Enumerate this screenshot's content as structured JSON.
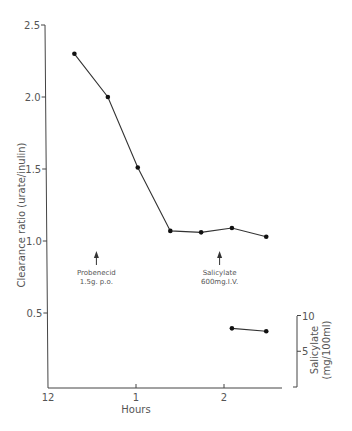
{
  "chart_data": {
    "type": "line",
    "title": "",
    "xlabel": "Hours",
    "ylabel": "Clearance ratio (urate/inulin)",
    "y2label": "Salicylate (mg/100ml)",
    "x_ticks": [
      "12",
      "1",
      "2"
    ],
    "x_tick_values": [
      0,
      1,
      2
    ],
    "y_ticks": [
      "0.5",
      "1.0",
      "1.5",
      "2.0",
      "2.5"
    ],
    "y_tick_values": [
      0.5,
      1.0,
      1.5,
      2.0,
      2.5
    ],
    "y2_ticks": [
      "5",
      "10"
    ],
    "y2_tick_values": [
      5,
      10
    ],
    "xlim": [
      0,
      2.65
    ],
    "ylim": [
      0.0,
      2.5
    ],
    "y2lim": [
      0,
      10
    ],
    "grid": false,
    "legend": "none",
    "series": [
      {
        "name": "Clearance ratio (urate/inulin)",
        "axis": "left",
        "x": [
          0.3,
          0.68,
          1.02,
          1.39,
          1.74,
          2.09,
          2.48
        ],
        "y": [
          2.3,
          2.0,
          1.51,
          1.07,
          1.06,
          1.09,
          1.03
        ]
      },
      {
        "name": "Salicylate (mg/100ml)",
        "axis": "right",
        "x": [
          2.09,
          2.48
        ],
        "y": [
          8.2,
          7.8
        ]
      }
    ],
    "annotations": [
      {
        "text_lines": [
          "Probenecid",
          "1.5g. p.o."
        ],
        "x": 0.55,
        "arrow": "up"
      },
      {
        "text_lines": [
          "Salicylate",
          "600mg.I.V."
        ],
        "x": 1.95,
        "arrow": "up"
      }
    ]
  }
}
